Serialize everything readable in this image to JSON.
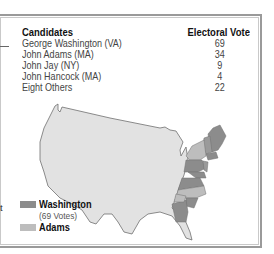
{
  "table": {
    "headers": {
      "candidates": "Candidates",
      "votes": "Electoral Vote"
    },
    "rows": [
      {
        "name": "George Washington (VA)",
        "votes": "69"
      },
      {
        "name": "John Adams (MA)",
        "votes": "34"
      },
      {
        "name": "John Jay (NY)",
        "votes": "9"
      },
      {
        "name": "John Hancock (MA)",
        "votes": "4"
      },
      {
        "name": "Eight Others",
        "votes": "22"
      }
    ]
  },
  "legend": {
    "items": [
      {
        "label": "Washington",
        "sub": "(69 Votes)",
        "color": "#8c8c8c"
      },
      {
        "label": "Adams",
        "color": "#bdbdbd"
      }
    ]
  },
  "side_text": "t",
  "colors": {
    "washington": "#8c8c8c",
    "adams": "#bdbdbd",
    "land": "#e2e2e2",
    "outline": "#707070"
  }
}
